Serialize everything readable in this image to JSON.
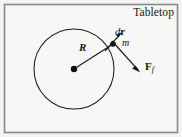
{
  "figure": {
    "title": "Tabletop",
    "background_color": "#f3f3f1",
    "border_color": "#8a8a8a",
    "stroke_color": "#1a1a1a",
    "labels": {
      "radius": "R",
      "displacement_d": "d",
      "displacement_r": "r",
      "mass": "m",
      "force_main": "F",
      "force_subscript": "f"
    },
    "geometry": {
      "circle_center_x": 74,
      "circle_center_y": 69,
      "circle_radius": 40,
      "mass_point_x": 113,
      "mass_point_y": 44,
      "center_dot_radius": 3.2,
      "mass_dot_radius": 2.8,
      "dr_arrow_tip_x": 121,
      "dr_arrow_tip_y": 33,
      "friction_arrow_tip_x": 140,
      "friction_arrow_tip_y": 72
    }
  }
}
